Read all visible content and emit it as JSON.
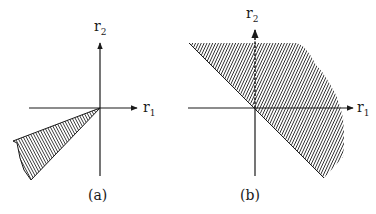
{
  "panels": [
    {
      "id": "a",
      "caption": "(a)",
      "x_axis_label": "r",
      "x_axis_sub": "1",
      "y_axis_label": "r",
      "y_axis_sub": "2",
      "region": "narrow cone in the third quadrant bounded by rays from the origin"
    },
    {
      "id": "b",
      "caption": "(b)",
      "x_axis_label": "r",
      "x_axis_sub": "1",
      "y_axis_label": "r",
      "y_axis_sub": "2",
      "region": "half-plane above the line r2 = -r1, truncated (shaded), with dashed positive r2 axis inside"
    }
  ],
  "colors": {
    "ink": "#1a1a1a",
    "background": "#ffffff"
  }
}
